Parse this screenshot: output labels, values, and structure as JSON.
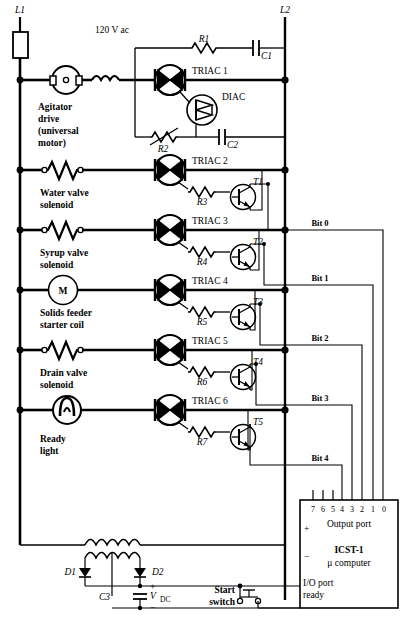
{
  "supply": {
    "left_rail_label": "L1",
    "right_rail_label": "L2",
    "voltage_label": "120 V ac",
    "fuse_name": "fuse"
  },
  "snubber": {
    "resistor": "R1",
    "capacitor": "C1"
  },
  "phase_control": {
    "triac": "TRIAC 1",
    "diac": "DIAC",
    "pot": "R2",
    "cap": "C2"
  },
  "loads": [
    {
      "name": "Agitator drive (universal motor)",
      "name_lines": [
        "Agitator",
        "drive",
        "(universal",
        "motor)"
      ],
      "symbol": "universal-motor",
      "triac": "TRIAC 1",
      "gate_resistor": "",
      "transistor": "",
      "bit": ""
    },
    {
      "name": "Water valve solenoid",
      "name_lines": [
        "Water valve",
        "solenoid"
      ],
      "symbol": "solenoid",
      "triac": "TRIAC 2",
      "gate_resistor": "R3",
      "transistor": "T1",
      "bit": "Bit  0"
    },
    {
      "name": "Syrup valve solenoid",
      "name_lines": [
        "Syrup valve",
        "solenoid"
      ],
      "symbol": "solenoid",
      "triac": "TRIAC 3",
      "gate_resistor": "R4",
      "transistor": "T2",
      "bit": "Bit  1"
    },
    {
      "name": "Solids feeder starter coil",
      "name_lines": [
        "Solids feeder",
        "starter coil"
      ],
      "symbol": "motor-M",
      "symbol_text": "M",
      "triac": "TRIAC 4",
      "gate_resistor": "R5",
      "transistor": "T3",
      "bit": "Bit  2"
    },
    {
      "name": "Drain valve solenoid",
      "name_lines": [
        "Drain valve",
        "solenoid"
      ],
      "symbol": "solenoid",
      "triac": "TRIAC 5",
      "gate_resistor": "R6",
      "transistor": "T4",
      "bit": "Bit  3"
    },
    {
      "name": "Ready light",
      "name_lines": [
        "Ready",
        "light"
      ],
      "symbol": "lamp",
      "triac": "TRIAC 6",
      "gate_resistor": "R7",
      "transistor": "T5",
      "bit": "Bit  4"
    }
  ],
  "power_supply": {
    "transformer": "center-tapped-transformer",
    "diode1": "D1",
    "diode2": "D2",
    "capacitor": "C3",
    "output_label": "V",
    "output_sub": "DC",
    "plus": "+",
    "minus": "−"
  },
  "start_switch": {
    "label_lines": [
      "Start",
      "switch"
    ],
    "type": "normally-open-pushbutton"
  },
  "computer": {
    "port_title": "Output port",
    "model": "ICST-1",
    "model_sub": "μ computer",
    "io_lines": [
      "I/O port",
      "ready"
    ],
    "pins": [
      "7",
      "6",
      "5",
      "4",
      "3",
      "2",
      "1",
      "0"
    ],
    "plus_terminal": "+",
    "minus_terminal": "−"
  }
}
